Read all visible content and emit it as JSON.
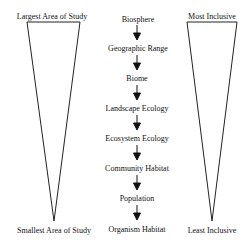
{
  "left_triangle": {
    "top_label": "Largest Area of Study",
    "bottom_label": "Smallest Area of Study"
  },
  "right_triangle": {
    "top_label": "Most Inclusive",
    "bottom_label": "Least Inclusive"
  },
  "hierarchy": [
    "Biosphere",
    "Geographic Range",
    "Biome",
    "Landscape Ecology",
    "Ecosystem Ecology",
    "Community Habitat",
    "Population",
    "Organism Habitat"
  ],
  "colors": {
    "stroke": "#222222",
    "text": "#111111",
    "background": "#ffffff"
  }
}
